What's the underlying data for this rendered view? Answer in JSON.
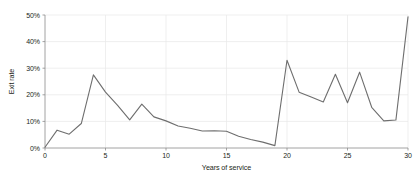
{
  "chart_data": {
    "type": "line",
    "title": "",
    "xlabel": "Years of service",
    "ylabel": "Exit rate",
    "xlim": [
      0,
      30
    ],
    "ylim": [
      0,
      50
    ],
    "grid": true,
    "legend": false,
    "x_ticks": [
      "0",
      "5",
      "10",
      "15",
      "20",
      "25",
      "30"
    ],
    "x_tick_values": [
      0,
      5,
      10,
      15,
      20,
      25,
      30
    ],
    "y_ticks": [
      "0%",
      "10%",
      "20%",
      "30%",
      "40%",
      "50%"
    ],
    "y_tick_values": [
      0,
      10,
      20,
      30,
      40,
      50
    ],
    "series": [
      {
        "name": "Exit rate",
        "color": "#6e6e6e",
        "x": [
          0,
          1,
          2,
          3,
          4,
          5,
          6,
          7,
          8,
          9,
          10,
          11,
          12,
          13,
          14,
          15,
          16,
          17,
          18,
          19,
          20,
          21,
          22,
          23,
          24,
          25,
          26,
          27,
          28,
          29,
          30
        ],
        "values": [
          0.3,
          6.7,
          5.2,
          9.2,
          27.5,
          21.0,
          16.0,
          10.6,
          16.5,
          11.7,
          10.2,
          8.3,
          7.4,
          6.4,
          6.5,
          6.3,
          4.4,
          3.2,
          2.2,
          0.9,
          33.0,
          21.0,
          19.2,
          17.3,
          27.7,
          17.0,
          28.5,
          15.3,
          10.2,
          10.5,
          49.3
        ]
      }
    ]
  },
  "axis": {
    "x_title": "Years of service",
    "y_title": "Exit rate"
  }
}
